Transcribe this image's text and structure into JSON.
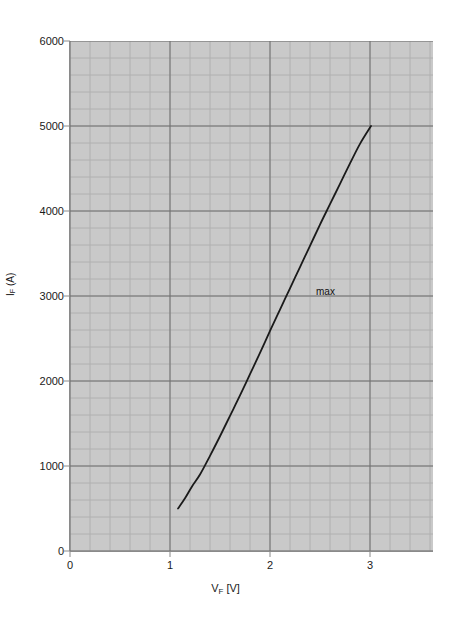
{
  "chart_data": {
    "type": "line",
    "title": "",
    "xlabel": "VF [V]",
    "xlabel_base": "V",
    "xlabel_sub": "F",
    "xlabel_unit": " [V]",
    "ylabel": "I F (A)",
    "ylabel_base": "I",
    "ylabel_sub": "F",
    "ylabel_unit": " (A)",
    "xlim": [
      0,
      3.63
    ],
    "ylim": [
      0,
      6000
    ],
    "xticks": [
      0,
      1,
      2,
      3
    ],
    "xtick_labels": [
      "0",
      "1",
      "2",
      "3"
    ],
    "yticks": [
      0,
      1000,
      2000,
      3000,
      4000,
      5000,
      6000
    ],
    "ytick_labels": [
      "0",
      "1000",
      "2000",
      "3000",
      "4000",
      "5000",
      "6000"
    ],
    "x_minor_step": 0.2,
    "y_minor_step": 200,
    "grid": true,
    "grid_major_color": "#6e6e6e",
    "grid_minor_color": "#b0b0b0",
    "plot_bg_color": "#c9c9c9",
    "page_bg_color": "#ffffff",
    "legend_position": "inline-annotation",
    "series": [
      {
        "name": "max",
        "color": "#1a1a1a",
        "line_width": 1.8,
        "annotation": "max",
        "annotation_x": 2.46,
        "annotation_y": 3050,
        "x": [
          1.08,
          1.15,
          1.22,
          1.3,
          1.4,
          1.5,
          1.6,
          1.7,
          1.8,
          1.9,
          2.0,
          2.1,
          2.2,
          2.3,
          2.4,
          2.5,
          2.6,
          2.7,
          2.8,
          2.9,
          3.01
        ],
        "y": [
          500,
          620,
          760,
          900,
          1120,
          1350,
          1590,
          1830,
          2080,
          2330,
          2590,
          2840,
          3090,
          3340,
          3590,
          3840,
          4080,
          4320,
          4560,
          4790,
          5000
        ]
      }
    ]
  },
  "axes": {
    "x_axis_name": "voltage-axis",
    "y_axis_name": "current-axis"
  }
}
